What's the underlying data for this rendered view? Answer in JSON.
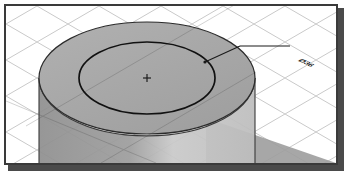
{
  "app": {
    "title": "3D Isometric Viewport",
    "background_color": "#ffffff",
    "frame_color": "#3a3a3a",
    "shadow_color": "#4a4a4a"
  },
  "viewport": {
    "width": 334,
    "height": 161,
    "grid": {
      "name": "isometric-grid",
      "line_color": "#c9c9c9",
      "spacing": 36,
      "angle_degrees": 30,
      "visible": true
    },
    "ground_plane": {
      "name": "ground-plane",
      "fill": "#ffffff",
      "shadow_fill": "#9b9b9b"
    }
  },
  "model": {
    "name": "cylinder-with-counterbore",
    "top_face": {
      "label": "top-face",
      "fill": "#a8a8a8",
      "stroke": "#2b2b2b",
      "center_x": 147,
      "center_y": 76,
      "radius_x": 97,
      "radius_y": 52
    },
    "inner_circle": {
      "label": "inner-bore-circle",
      "fill": "#a8a8a8",
      "stroke": "#1a1a1a",
      "center_x": 147,
      "center_y": 76,
      "radius_x": 61,
      "radius_y": 33
    },
    "body": {
      "label": "cylinder-body",
      "fill_left": "#9a9a9a",
      "fill_right": "#c4c4c4",
      "stroke": "#2b2b2b",
      "height": 120
    },
    "center_marker": {
      "label": "center-mark",
      "glyph": "+",
      "x": 147,
      "y": 76,
      "color": "#222222"
    }
  },
  "annotation": {
    "name": "diameter-dimension",
    "leader": {
      "label": "leader-line",
      "color": "#1a1a1a",
      "start_x": 201,
      "start_y": 60,
      "elbow_x": 240,
      "elbow_y": 44,
      "end_x": 286,
      "end_y": 44
    },
    "text": "Ø36",
    "text_x": 291,
    "text_y": 54,
    "text_color": "#1a1a1a"
  }
}
